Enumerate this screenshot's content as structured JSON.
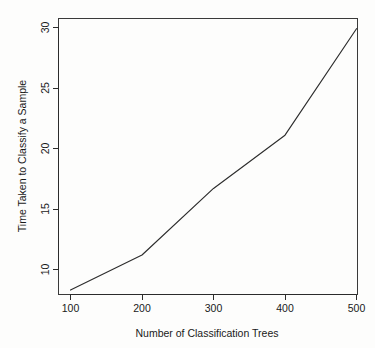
{
  "chart_data": {
    "type": "line",
    "title": "",
    "xlabel": "Number of Classification Trees",
    "ylabel": "Time Taken to Classify a Sample",
    "x": [
      100,
      200,
      300,
      400,
      500
    ],
    "values": [
      8.3,
      11.2,
      16.7,
      21.1,
      29.9
    ],
    "series": [
      {
        "name": "Time Taken to Classify a Sample",
        "values": [
          8.3,
          11.2,
          16.7,
          21.1,
          29.9
        ]
      }
    ],
    "xticks": [
      "100",
      "200",
      "300",
      "400",
      "500"
    ],
    "xtick_values": [
      100,
      200,
      300,
      400,
      500
    ],
    "yticks": [
      "10",
      "15",
      "20",
      "25",
      "30"
    ],
    "ytick_values": [
      10,
      15,
      20,
      25,
      30
    ],
    "xlim": [
      88,
      512
    ],
    "ylim": [
      7.4,
      30.9
    ],
    "grid": false,
    "legend": "none",
    "line_color": "#2d2d2d",
    "background_color": "#fdfdfc",
    "axis_color": "#2b2b2b"
  },
  "axis": {
    "x_title": "Number of Classification Trees",
    "y_title": "Time Taken to Classify a Sample",
    "x_tick_labels": [
      "100",
      "200",
      "300",
      "400",
      "500"
    ],
    "y_tick_labels": [
      "10",
      "15",
      "20",
      "25",
      "30"
    ]
  }
}
